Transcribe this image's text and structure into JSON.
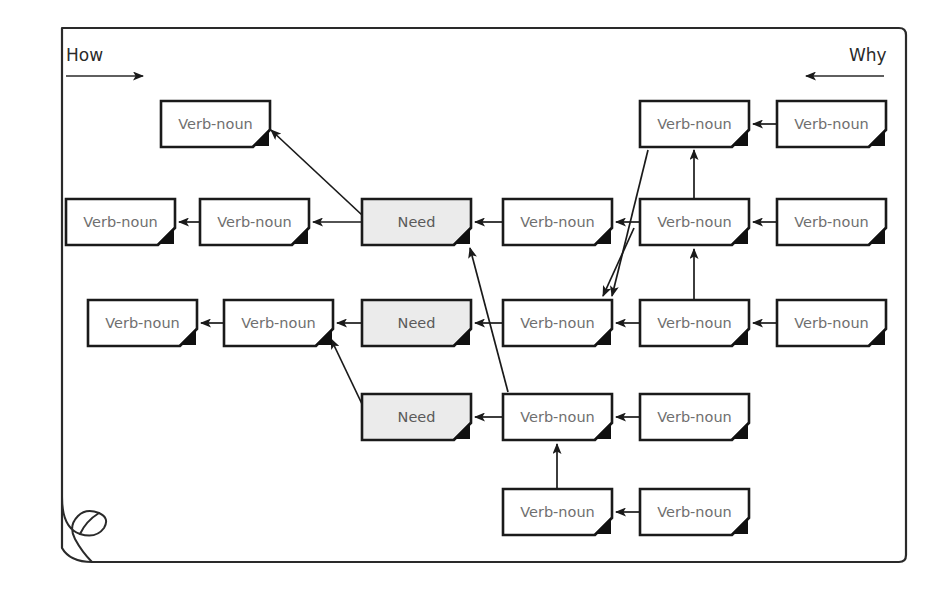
{
  "page": {
    "width": 951,
    "height": 591,
    "background": "#ffffff",
    "frame_color": "#2a2a2a"
  },
  "axes": {
    "left": {
      "label": "How",
      "direction": "right",
      "label_x": 66,
      "label_y": 56,
      "line_x1": 66,
      "line_x2": 143,
      "line_y": 76
    },
    "right": {
      "label": "Why",
      "direction": "left",
      "label_x": 849,
      "label_y": 56,
      "line_x1": 884,
      "line_x2": 806,
      "line_y": 76
    }
  },
  "style": {
    "node_fill": "#ffffff",
    "need_fill": "#ebebeb",
    "node_stroke": "#1a1a1a",
    "fold_fill": "#101010",
    "label_color": "#6f6f6f",
    "connector_color": "#1a1a1a",
    "node_width": 109,
    "node_height": 46,
    "fold_size": 17
  },
  "labels": {
    "verb_noun": "Verb-noun",
    "need": "Need"
  },
  "nodes": [
    {
      "id": "n-r1-c3",
      "label": "Verb-noun",
      "kind": "verb-noun",
      "x": 161,
      "y": 101,
      "row": 1,
      "col": 3
    },
    {
      "id": "n-r1-c7",
      "label": "Verb-noun",
      "kind": "verb-noun",
      "x": 640,
      "y": 101,
      "row": 1,
      "col": 7
    },
    {
      "id": "n-r1-c8",
      "label": "Verb-noun",
      "kind": "verb-noun",
      "x": 777,
      "y": 101,
      "row": 1,
      "col": 8
    },
    {
      "id": "n-r2-c1",
      "label": "Verb-noun",
      "kind": "verb-noun",
      "x": 66,
      "y": 199,
      "row": 2,
      "col": 1
    },
    {
      "id": "n-r2-c2",
      "label": "Verb-noun",
      "kind": "verb-noun",
      "x": 200,
      "y": 199,
      "row": 2,
      "col": 2
    },
    {
      "id": "n-r2-c3",
      "label": "Need",
      "kind": "need",
      "x": 362,
      "y": 199,
      "row": 2,
      "col": 3
    },
    {
      "id": "n-r2-c6",
      "label": "Verb-noun",
      "kind": "verb-noun",
      "x": 503,
      "y": 199,
      "row": 2,
      "col": 6
    },
    {
      "id": "n-r2-c7",
      "label": "Verb-noun",
      "kind": "verb-noun",
      "x": 640,
      "y": 199,
      "row": 2,
      "col": 7
    },
    {
      "id": "n-r2-c8",
      "label": "Verb-noun",
      "kind": "verb-noun",
      "x": 777,
      "y": 199,
      "row": 2,
      "col": 8
    },
    {
      "id": "n-r3-c1",
      "label": "Verb-noun",
      "kind": "verb-noun",
      "x": 88,
      "y": 300,
      "row": 3,
      "col": 1
    },
    {
      "id": "n-r3-c2",
      "label": "Verb-noun",
      "kind": "verb-noun",
      "x": 224,
      "y": 300,
      "row": 3,
      "col": 2
    },
    {
      "id": "n-r3-c3",
      "label": "Need",
      "kind": "need",
      "x": 362,
      "y": 300,
      "row": 3,
      "col": 3
    },
    {
      "id": "n-r3-c6",
      "label": "Verb-noun",
      "kind": "verb-noun",
      "x": 503,
      "y": 300,
      "row": 3,
      "col": 6
    },
    {
      "id": "n-r3-c7",
      "label": "Verb-noun",
      "kind": "verb-noun",
      "x": 640,
      "y": 300,
      "row": 3,
      "col": 7
    },
    {
      "id": "n-r3-c8",
      "label": "Verb-noun",
      "kind": "verb-noun",
      "x": 777,
      "y": 300,
      "row": 3,
      "col": 8
    },
    {
      "id": "n-r4-c3",
      "label": "Need",
      "kind": "need",
      "x": 362,
      "y": 394,
      "row": 4,
      "col": 3
    },
    {
      "id": "n-r4-c6",
      "label": "Verb-noun",
      "kind": "verb-noun",
      "x": 503,
      "y": 394,
      "row": 4,
      "col": 6
    },
    {
      "id": "n-r4-c7",
      "label": "Verb-noun",
      "kind": "verb-noun",
      "x": 640,
      "y": 394,
      "row": 4,
      "col": 7
    },
    {
      "id": "n-r5-c6",
      "label": "Verb-noun",
      "kind": "verb-noun",
      "x": 503,
      "y": 489,
      "row": 5,
      "col": 6
    },
    {
      "id": "n-r5-c7",
      "label": "Verb-noun",
      "kind": "verb-noun",
      "x": 640,
      "y": 489,
      "row": 5,
      "col": 7
    }
  ],
  "connectors": [
    {
      "id": "c-r1-c8-to-c7",
      "from": "n-r1-c8",
      "to": "n-r1-c7",
      "points": "777,124 753,124",
      "kind": "horizontal"
    },
    {
      "id": "c-r2-c2-to-c1",
      "from": "n-r2-c2",
      "to": "n-r2-c1",
      "points": "200,222 179,222",
      "kind": "horizontal"
    },
    {
      "id": "c-r2-c3-to-c2",
      "from": "n-r2-c3",
      "to": "n-r2-c2",
      "points": "362,222 313,222",
      "kind": "horizontal"
    },
    {
      "id": "c-r2-c6-to-c3",
      "from": "n-r2-c6",
      "to": "n-r2-c3",
      "points": "503,222 475,222",
      "kind": "horizontal"
    },
    {
      "id": "c-r2-c7-to-c6",
      "from": "n-r2-c7",
      "to": "n-r2-c6",
      "points": "640,222 616,222",
      "kind": "horizontal"
    },
    {
      "id": "c-r2-c8-to-c7",
      "from": "n-r2-c8",
      "to": "n-r2-c7",
      "points": "777,222 753,222",
      "kind": "horizontal"
    },
    {
      "id": "c-r3-c2-to-c1",
      "from": "n-r3-c2",
      "to": "n-r3-c1",
      "points": "224,323 201,323",
      "kind": "horizontal"
    },
    {
      "id": "c-r3-c3-to-c2",
      "from": "n-r3-c3",
      "to": "n-r3-c2",
      "points": "362,323 337,323",
      "kind": "horizontal"
    },
    {
      "id": "c-r3-c6-to-c3",
      "from": "n-r3-c6",
      "to": "n-r3-c3",
      "points": "503,323 475,323",
      "kind": "horizontal"
    },
    {
      "id": "c-r3-c7-to-c6",
      "from": "n-r3-c7",
      "to": "n-r3-c6",
      "points": "640,323 616,323",
      "kind": "horizontal"
    },
    {
      "id": "c-r3-c8-to-c7",
      "from": "n-r3-c8",
      "to": "n-r3-c7",
      "points": "777,323 753,323",
      "kind": "horizontal"
    },
    {
      "id": "c-r4-c6-to-c3",
      "from": "n-r4-c6",
      "to": "n-r4-c3",
      "points": "503,417 475,417",
      "kind": "horizontal"
    },
    {
      "id": "c-r4-c7-to-c6",
      "from": "n-r4-c7",
      "to": "n-r4-c6",
      "points": "640,417 616,417",
      "kind": "horizontal"
    },
    {
      "id": "c-r5-c7-to-c6",
      "from": "n-r5-c7",
      "to": "n-r5-c6",
      "points": "640,512 616,512",
      "kind": "horizontal"
    },
    {
      "id": "c-r2-c7-up",
      "from": "n-r2-c7",
      "to": "n-r1-c7",
      "points": "694,199 694,150",
      "kind": "vertical"
    },
    {
      "id": "c-r3-c7-up",
      "from": "n-r3-c7",
      "to": "n-r2-c7",
      "points": "694,300 694,249",
      "kind": "vertical"
    },
    {
      "id": "c-r5-c6-up",
      "from": "n-r5-c6",
      "to": "n-r4-c6",
      "points": "557,489 557,444",
      "kind": "vertical"
    },
    {
      "id": "c-r2-c3-diag-up",
      "from": "n-r2-c3",
      "to": "n-r1-c3",
      "points": "362,215 271,130",
      "kind": "diagonal"
    },
    {
      "id": "c-r4-c3-diag-up",
      "from": "n-r4-c3",
      "to": "n-r3-c2",
      "points": "362,404 331,339",
      "kind": "diagonal"
    },
    {
      "id": "c-r4-c6-diag-up",
      "from": "n-r4-c6",
      "to": "n-r2-c3",
      "points": "508,392 470,248",
      "kind": "diagonal"
    },
    {
      "id": "c-r1-c7-diag-down",
      "from": "n-r1-c7",
      "to": "n-r3-c6",
      "points": "648,150 612,296",
      "kind": "diagonal"
    },
    {
      "id": "c-r2-c7-diag-down",
      "from": "n-r2-c7",
      "to": "n-r3-c6",
      "points": "634,228 603,296",
      "kind": "diagonal"
    }
  ]
}
